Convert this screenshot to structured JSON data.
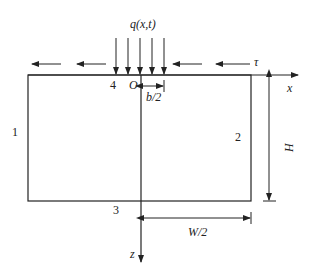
{
  "diagram": {
    "load_label": "q(x,t)",
    "shear_label": "τ",
    "origin_label": "O",
    "x_axis_label": "x",
    "z_axis_label": "z",
    "half_load_width_label": "b/2",
    "half_width_label": "W/2",
    "height_label": "H",
    "boundaries": {
      "left": "1",
      "right": "2",
      "bottom": "3",
      "top": "4"
    },
    "colors": {
      "line": "#222222",
      "background": "#ffffff"
    }
  }
}
